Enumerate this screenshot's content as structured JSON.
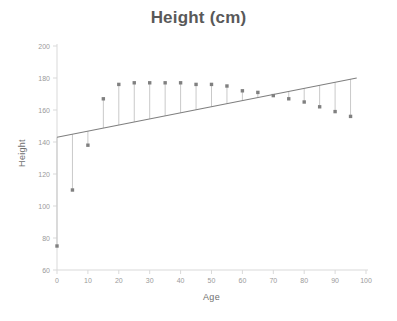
{
  "chart_data": {
    "type": "scatter",
    "title": "Height (cm)",
    "xlabel": "Age",
    "ylabel": "Height",
    "xlim": [
      0,
      100
    ],
    "ylim": [
      60,
      200
    ],
    "xticks": [
      0,
      10,
      20,
      30,
      40,
      50,
      60,
      70,
      80,
      90,
      100
    ],
    "yticks": [
      60,
      80,
      100,
      120,
      140,
      160,
      180,
      200
    ],
    "grid": false,
    "legend": null,
    "series": [
      {
        "name": "Height",
        "marker": "square",
        "color": "#808080",
        "x": [
          0,
          5,
          10,
          15,
          20,
          25,
          30,
          35,
          40,
          45,
          50,
          55,
          60,
          65,
          70,
          75,
          80,
          85,
          90,
          95
        ],
        "y": [
          75,
          110,
          138,
          167,
          176,
          177,
          177,
          177,
          177,
          176,
          176,
          175,
          172,
          171,
          169,
          167,
          165,
          162,
          159,
          156
        ]
      }
    ],
    "trendline": {
      "name": "Linear fit",
      "color": "#7f7f7f",
      "x": [
        0,
        97
      ],
      "y": [
        143,
        180
      ]
    },
    "residual_lines": {
      "description": "vertical drop lines from trendline to each data point",
      "color": "#c9c9c9"
    },
    "annotations": []
  },
  "axis_labels": {
    "x": "Age",
    "y": "Height"
  },
  "title": "Height (cm)",
  "colors": {
    "title": "#595959",
    "axis_text": "#9a9a9a",
    "axis_line": "#d9d9d9",
    "marker": "#808080",
    "trend": "#7f7f7f",
    "residual": "#c9c9c9",
    "background": "#ffffff"
  }
}
